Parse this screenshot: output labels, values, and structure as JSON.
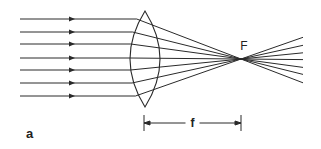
{
  "diagram": {
    "panel_label": "a",
    "focus_label": "F",
    "focal_length_label": "f",
    "colors": {
      "ink": "#2a2a2a",
      "background": "#ffffff"
    },
    "incoming_rays_y": [
      19,
      32,
      44,
      58,
      70,
      83,
      96
    ],
    "ray_start_x": 20,
    "arrow_x": 74,
    "lens": {
      "center_x": 145,
      "top_y": 11,
      "bottom_y": 107,
      "left_bulge_x": 130,
      "right_bulge_x": 160
    },
    "focus": {
      "x": 241,
      "y": 59
    },
    "dimension": {
      "y": 123,
      "x_start": 144,
      "x_end": 241
    }
  }
}
